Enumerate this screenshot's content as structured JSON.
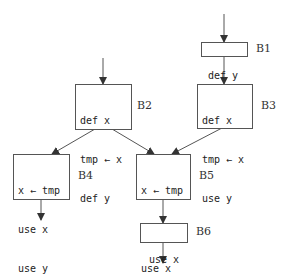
{
  "diagram": {
    "type": "control-flow-graph",
    "arrow_glyph": "←",
    "colors": {
      "line": "#555555",
      "text": "#222222",
      "background": "#ffffff"
    },
    "blocks": [
      {
        "id": "B1",
        "label": "B1",
        "lines": [
          "def y"
        ]
      },
      {
        "id": "B2",
        "label": "B2",
        "lines": [
          "def x",
          "tmp ← x",
          "def y"
        ]
      },
      {
        "id": "B3",
        "label": "B3",
        "lines": [
          "def x",
          "tmp ← x",
          "use y"
        ]
      },
      {
        "id": "B4",
        "label": "B4",
        "lines": [
          "x ← tmp",
          "use x",
          "use y"
        ]
      },
      {
        "id": "B5",
        "label": "B5",
        "lines": [
          "x ← tmp",
          "use x",
          "use x"
        ]
      },
      {
        "id": "B6",
        "label": "B6",
        "lines": [
          "use x"
        ]
      }
    ],
    "edges": [
      {
        "from": "entry",
        "to": "B1"
      },
      {
        "from": "entry",
        "to": "B2"
      },
      {
        "from": "B1",
        "to": "B3"
      },
      {
        "from": "B2",
        "to": "B4"
      },
      {
        "from": "B2",
        "to": "B5"
      },
      {
        "from": "B3",
        "to": "B5"
      },
      {
        "from": "B4",
        "to": "exit"
      },
      {
        "from": "B5",
        "to": "B6"
      },
      {
        "from": "B6",
        "to": "exit"
      }
    ]
  }
}
